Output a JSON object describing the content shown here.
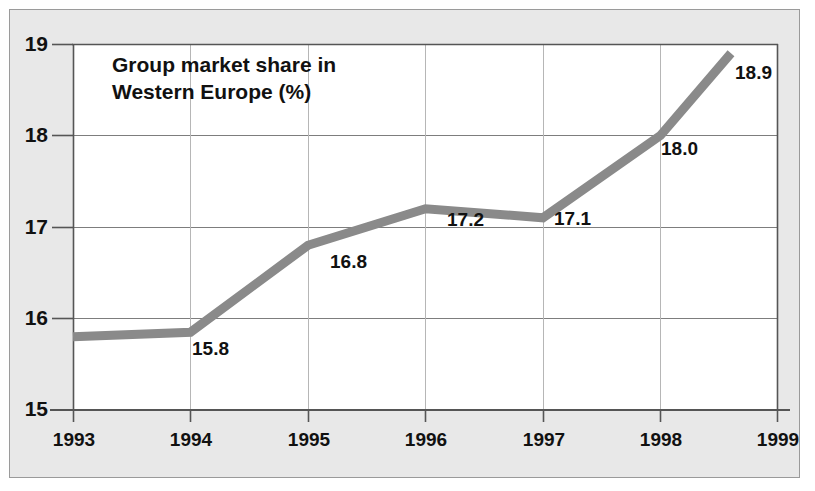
{
  "chart_data": {
    "type": "line",
    "title": "Group market share in\nWestern Europe (%)",
    "xlabel": "",
    "ylabel": "",
    "x": [
      1993,
      1994,
      1995,
      1996,
      1997,
      1998,
      1998.6
    ],
    "categories": [
      "1993",
      "1994",
      "1995",
      "1996",
      "1997",
      "1998",
      "1999"
    ],
    "values": [
      15.8,
      15.85,
      16.8,
      17.2,
      17.1,
      18.0,
      18.9
    ],
    "point_labels": [
      "",
      "15.8",
      "16.8",
      "17.2",
      "17.1",
      "18.0",
      "18.9"
    ],
    "xlim": [
      1993,
      1999
    ],
    "ylim": [
      15,
      19
    ],
    "xticks": [
      "1993",
      "1994",
      "1995",
      "1996",
      "1997",
      "1998",
      "1999"
    ],
    "yticks": [
      "15",
      "16",
      "17",
      "18",
      "19"
    ],
    "grid": true,
    "legend": "none",
    "series": [
      {
        "name": "Group market share in Western Europe (%)",
        "values": [
          15.8,
          15.85,
          16.8,
          17.2,
          17.1,
          18.0,
          18.9
        ]
      }
    ],
    "colors": {
      "line": "#8a8a8a",
      "grid": "#9a9a9a",
      "axis": "#555555",
      "text": "#111111",
      "panel_background": "#e8e8e8",
      "plot_background": "#ffffff"
    }
  },
  "axes": {
    "y_ticks": [
      {
        "label": "19",
        "value": 19
      },
      {
        "label": "18",
        "value": 18
      },
      {
        "label": "17",
        "value": 17
      },
      {
        "label": "16",
        "value": 16
      },
      {
        "label": "15",
        "value": 15
      }
    ],
    "x_ticks": [
      {
        "label": "1993",
        "value": 1993
      },
      {
        "label": "1994",
        "value": 1994
      },
      {
        "label": "1995",
        "value": 1995
      },
      {
        "label": "1996",
        "value": 1996
      },
      {
        "label": "1997",
        "value": 1997
      },
      {
        "label": "1998",
        "value": 1998
      },
      {
        "label": "1999",
        "value": 1999
      }
    ]
  },
  "data_labels": [
    {
      "text": "15.8",
      "value": 15.8,
      "year": "1994"
    },
    {
      "text": "16.8",
      "value": 16.8,
      "year": "1995"
    },
    {
      "text": "17.2",
      "value": 17.2,
      "year": "1996"
    },
    {
      "text": "17.1",
      "value": 17.1,
      "year": "1997"
    },
    {
      "text": "18.0",
      "value": 18.0,
      "year": "1998"
    },
    {
      "text": "18.9",
      "value": 18.9,
      "year": "1999"
    }
  ]
}
